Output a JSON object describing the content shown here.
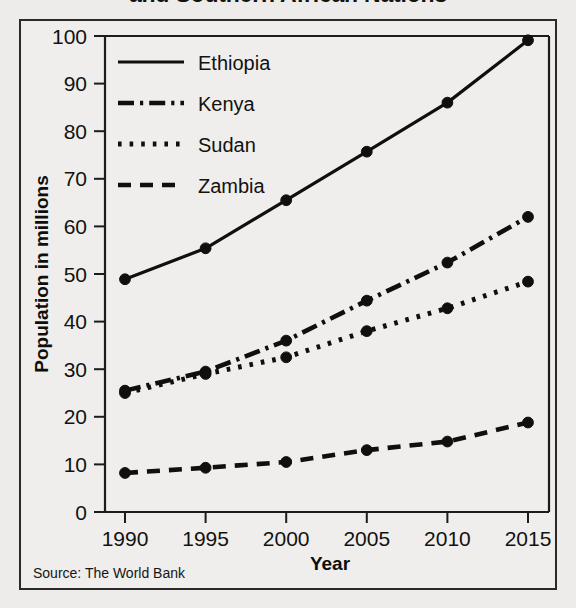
{
  "figure": {
    "title_partial": "and Southern African Nations",
    "source_note": "Source: The World Bank"
  },
  "chart_data": {
    "type": "line",
    "title": "and Southern African Nations",
    "xlabel": "Year",
    "ylabel": "Population in millions",
    "x": [
      1990,
      1995,
      2000,
      2005,
      2010,
      2015
    ],
    "xtick_labels": [
      "1990",
      "1995",
      "2000",
      "2005",
      "2010",
      "2015"
    ],
    "ytick_labels": [
      "0",
      "10",
      "20",
      "30",
      "40",
      "50",
      "60",
      "70",
      "80",
      "90",
      "100"
    ],
    "ylim": [
      0,
      100
    ],
    "xlim": [
      1988,
      2017
    ],
    "grid": false,
    "legend_position": "upper-left-inside",
    "series": [
      {
        "name": "Ethiopia",
        "style": "solid",
        "values": [
          48.9,
          55.4,
          65.5,
          75.7,
          86.0,
          99.1
        ]
      },
      {
        "name": "Kenya",
        "style": "dash-dot",
        "values": [
          25.5,
          29.5,
          36.0,
          44.4,
          52.4,
          62.0
        ]
      },
      {
        "name": "Sudan",
        "style": "dotted",
        "values": [
          25.0,
          29.0,
          32.5,
          38.0,
          42.8,
          48.4
        ]
      },
      {
        "name": "Zambia",
        "style": "dashed",
        "values": [
          8.2,
          9.3,
          10.5,
          13.0,
          14.8,
          18.8
        ]
      }
    ],
    "colors": {
      "ink": "#100f0d",
      "paper": "#efeeec"
    }
  },
  "ghost_text": [
    "ECONOMY AND TRADE",
    "AND SOUTH",
    "ECONOMIC DEVELOPM"
  ]
}
